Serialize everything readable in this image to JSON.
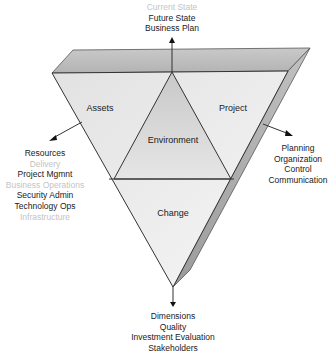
{
  "diagram": {
    "regions": {
      "assets": "Assets",
      "environment": "Environment",
      "project": "Project",
      "change": "Change"
    },
    "top_labels": [
      {
        "text": "Current State",
        "faded": true
      },
      {
        "text": "Future State",
        "faded": false
      },
      {
        "text": "Business Plan",
        "faded": false
      }
    ],
    "left_labels": [
      {
        "text": "Resources",
        "faded": false
      },
      {
        "text": "Delivery",
        "faded": true
      },
      {
        "text": "Project Mgmnt",
        "faded": false
      },
      {
        "text": "Business Operations",
        "faded": true
      },
      {
        "text": "Security Admin",
        "faded": false
      },
      {
        "text": "Technology Ops",
        "faded": false
      },
      {
        "text": "Infrastructure",
        "faded": true
      }
    ],
    "right_labels": [
      {
        "text": "Planning",
        "faded": false
      },
      {
        "text": "Organization",
        "faded": false
      },
      {
        "text": "Control",
        "faded": false
      },
      {
        "text": "Communication",
        "faded": false
      }
    ],
    "bottom_labels": [
      {
        "text": "Dimensions",
        "faded": false
      },
      {
        "text": "Quality",
        "faded": false
      },
      {
        "text": "Investment Evaluation",
        "faded": false
      },
      {
        "text": "Stakeholders",
        "faded": false
      }
    ],
    "colors": {
      "top_face": "#bdbdbd",
      "front_face": "#ececec",
      "inner_triangle": "#d6d6d6",
      "side_face": "#a8a8a8",
      "stroke": "#333333",
      "faded_text": "#c4c4c4"
    }
  }
}
